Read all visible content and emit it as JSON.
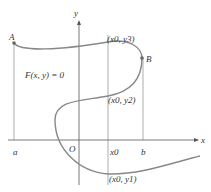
{
  "diagram": {
    "equation": "F(x, y) = 0",
    "axis_x_label": "x",
    "axis_y_label": "y",
    "origin_label": "O",
    "point_a_label": "A",
    "point_b_label": "B",
    "tick_a": "a",
    "tick_b": "b",
    "tick_x0": "x0",
    "p_y3": "(x0, y3)",
    "p_y2": "(x0, y2)",
    "p_y1": "(x0, y1)",
    "colors": {
      "curve": "#888888",
      "axes": "#555555",
      "text": "#333333"
    }
  }
}
